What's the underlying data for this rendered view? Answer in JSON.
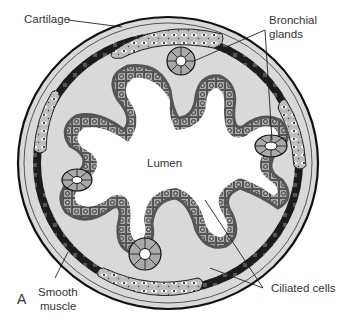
{
  "figure": {
    "panel_letter": "A",
    "labels": {
      "cartilage": "Cartilage",
      "bronchial_glands_1": "Bronchial",
      "bronchial_glands_2": "glands",
      "lumen": "Lumen",
      "smooth_muscle_1": "Smooth",
      "smooth_muscle_2": "muscle",
      "ciliated_cells": "Ciliated cells"
    },
    "colors": {
      "outline": "#1a1a1a",
      "wall_fill": "#d9d9d9",
      "muscle": "#222222",
      "epithelium": "#a6a6a6",
      "lumen": "#ffffff"
    }
  }
}
